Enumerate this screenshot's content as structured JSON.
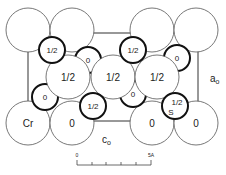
{
  "diagram": {
    "type": "crystal-structure-projection",
    "axis_labels": {
      "vertical": "a",
      "vertical_sub": "o",
      "horizontal": "c",
      "horizontal_sub": "o"
    },
    "large_atoms": [
      {
        "id": "L1",
        "cx": 28,
        "cy": 30,
        "label": ""
      },
      {
        "id": "L2",
        "cx": 72,
        "cy": 30,
        "label": ""
      },
      {
        "id": "L3",
        "cx": 152,
        "cy": 30,
        "label": ""
      },
      {
        "id": "L4",
        "cx": 196,
        "cy": 30,
        "label": ""
      },
      {
        "id": "L5",
        "cx": 68,
        "cy": 77,
        "label": "1/2"
      },
      {
        "id": "L6",
        "cx": 113,
        "cy": 77,
        "label": "1/2"
      },
      {
        "id": "L7",
        "cx": 157,
        "cy": 77,
        "label": "1/2"
      },
      {
        "id": "L8",
        "cx": 28,
        "cy": 123,
        "label": "Cr"
      },
      {
        "id": "L9",
        "cx": 72,
        "cy": 123,
        "label": "0"
      },
      {
        "id": "L10",
        "cx": 152,
        "cy": 123,
        "label": "0"
      },
      {
        "id": "L11",
        "cx": 196,
        "cy": 123,
        "label": "0"
      }
    ],
    "small_atoms": [
      {
        "id": "S1",
        "cx": 52,
        "cy": 50,
        "label": "1/2"
      },
      {
        "id": "S2",
        "cx": 133,
        "cy": 50,
        "label": "1/2"
      },
      {
        "id": "S3",
        "cx": 88,
        "cy": 60,
        "label": "0"
      },
      {
        "id": "S4",
        "cx": 177,
        "cy": 58,
        "label": "0"
      },
      {
        "id": "S5",
        "cx": 45,
        "cy": 97,
        "label": "0"
      },
      {
        "id": "S6",
        "cx": 93,
        "cy": 106,
        "label": "1/2"
      },
      {
        "id": "S7",
        "cx": 133,
        "cy": 94,
        "label": "0"
      },
      {
        "id": "S8",
        "cx": 175,
        "cy": 106,
        "label": "1/2",
        "extra_label": "S"
      }
    ],
    "scale_bar": {
      "start_label": "0",
      "end_label": "5A",
      "ticks": 5
    }
  }
}
